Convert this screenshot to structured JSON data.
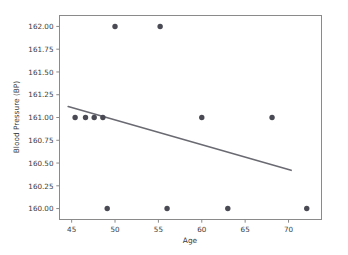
{
  "chart_data": {
    "type": "scatter",
    "title": "",
    "xlabel": "Age",
    "ylabel": "Blood Pressure (BP)",
    "xlim": [
      43.6,
      73.8
    ],
    "ylim": [
      159.88,
      162.12
    ],
    "xticks": [
      45,
      50,
      55,
      60,
      65,
      70
    ],
    "xticklabels": [
      "45",
      "50",
      "55",
      "60",
      "65",
      "70"
    ],
    "yticks": [
      160.0,
      160.25,
      160.5,
      160.75,
      161.0,
      161.25,
      161.5,
      161.75,
      162.0
    ],
    "yticklabels": [
      "160.00",
      "160.25",
      "160.50",
      "160.75",
      "161.00",
      "161.25",
      "161.50",
      "161.75",
      "162.00"
    ],
    "grid": false,
    "legend": null,
    "marker_color": "#4a4a55",
    "line_color": "#6a6a72",
    "points": [
      {
        "x": 45.4,
        "y": 161.0
      },
      {
        "x": 46.6,
        "y": 161.0
      },
      {
        "x": 47.6,
        "y": 161.0
      },
      {
        "x": 48.6,
        "y": 161.0
      },
      {
        "x": 49.1,
        "y": 160.0
      },
      {
        "x": 50.0,
        "y": 162.0
      },
      {
        "x": 55.2,
        "y": 162.0
      },
      {
        "x": 56.0,
        "y": 160.0
      },
      {
        "x": 60.0,
        "y": 161.0
      },
      {
        "x": 63.0,
        "y": 160.0
      },
      {
        "x": 68.1,
        "y": 161.0
      },
      {
        "x": 72.1,
        "y": 160.0
      }
    ],
    "trendline": {
      "x0": 44.6,
      "y0": 161.12,
      "x1": 70.3,
      "y1": 160.42
    }
  }
}
